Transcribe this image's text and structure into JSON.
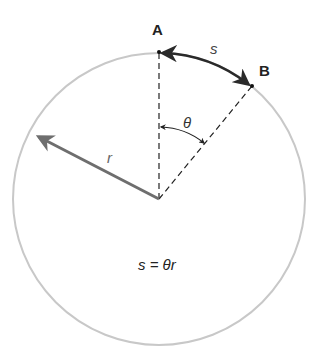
{
  "diagram": {
    "points": {
      "A": {
        "label": "A"
      },
      "B": {
        "label": "B"
      }
    },
    "labels": {
      "arc": "s",
      "angle": "θ",
      "radius": "r",
      "formula": "s = θr"
    },
    "colors": {
      "circle": "#c8c8c8",
      "radius_arrow": "#6e6e6e",
      "arc_arrow": "#2a2a2a",
      "dashed": "#222222",
      "text": "#222222"
    }
  }
}
